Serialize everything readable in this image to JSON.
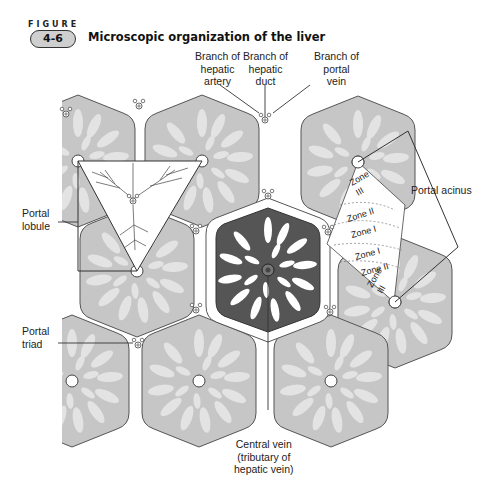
{
  "figure": {
    "label": "FIGURE",
    "number": "4-6",
    "title": "Microscopic organization of the liver"
  },
  "labels": {
    "branch_hepatic_artery": [
      "Branch of",
      "hepatic",
      "artery"
    ],
    "branch_hepatic_duct": [
      "Branch of",
      "hepatic",
      "duct"
    ],
    "branch_portal_vein": [
      "Branch of",
      "portal",
      "vein"
    ],
    "portal_lobule": [
      "Portal",
      "lobule"
    ],
    "portal_acinus": "Portal acinus",
    "portal_triad": [
      "Portal",
      "triad"
    ],
    "central_vein": [
      "Central vein",
      "(tributary of",
      "hepatic vein)"
    ]
  },
  "zones": {
    "upper": [
      "Zone III",
      "Zone II",
      "Zone I"
    ],
    "lower": [
      "Zone I",
      "Zone II",
      "Zone III"
    ]
  },
  "colors": {
    "lobule_fill": "#c6c6c6",
    "lobule_sinusoid": "#e2e2e2",
    "central_lobule": "#555555",
    "outline": "#444444",
    "background": "#ffffff"
  }
}
